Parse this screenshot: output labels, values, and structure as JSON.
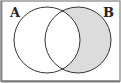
{
  "diagram": {
    "type": "venn",
    "sets": [
      {
        "label": "A",
        "cx": 47,
        "cy": 40,
        "r": 33
      },
      {
        "label": "B",
        "cx": 78,
        "cy": 40,
        "r": 33
      }
    ],
    "shaded_region": "B minus A",
    "colors": {
      "shade": "#dcdcdc",
      "stroke": "#333333",
      "frame": "#9a9a9a",
      "background": "#ffffff"
    }
  }
}
